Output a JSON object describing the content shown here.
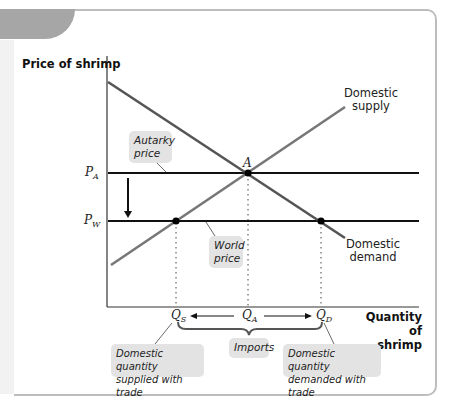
{
  "diagram": {
    "y_axis_label": "Price of shrimp",
    "x_axis_label_line1": "Quantity of",
    "x_axis_label_line2": "shrimp",
    "supply_label_line1": "Domestic",
    "supply_label_line2": "supply",
    "demand_label_line1": "Domestic",
    "demand_label_line2": "demand",
    "point_a_label": "A",
    "price_labels": {
      "pa_main": "P",
      "pa_sub": "A",
      "pw_main": "P",
      "pw_sub": "W"
    },
    "quantity_labels": {
      "qs_main": "Q",
      "qs_sub": "S",
      "qa_main": "Q",
      "qa_sub": "A",
      "qd_main": "Q",
      "qd_sub": "D"
    },
    "callouts": {
      "autarky_price_line1": "Autarky",
      "autarky_price_line2": "price",
      "world_price_line1": "World",
      "world_price_line2": "price",
      "imports": "Imports",
      "qs_note_line1": "Domestic quantity",
      "qs_note_line2": "supplied with trade",
      "qd_note_line1": "Domestic quantity",
      "qd_note_line2": "demanded with trade"
    },
    "colors": {
      "curve": "#666666",
      "price_line": "#111111",
      "axis": "#333333",
      "callout_bg": "#e3e3e3",
      "frame_border": "#bdbdbd",
      "tab": "#a6a6a6"
    }
  }
}
